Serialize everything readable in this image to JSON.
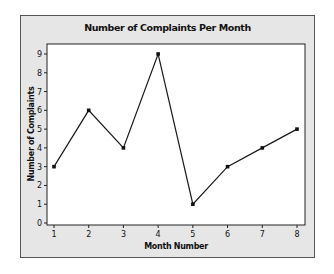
{
  "chart_data": {
    "type": "line",
    "title": "Number of Complaints Per Month",
    "xlabel": "Month Number",
    "ylabel": "Number of Complaints",
    "x": [
      1,
      2,
      3,
      4,
      5,
      6,
      7,
      8
    ],
    "values": [
      3,
      6,
      4,
      9,
      1,
      3,
      4,
      5
    ],
    "xticks": [
      "1",
      "2",
      "3",
      "4",
      "5",
      "6",
      "7",
      "8"
    ],
    "yticks": [
      "0",
      "1",
      "2",
      "3",
      "4",
      "5",
      "6",
      "7",
      "8",
      "9"
    ],
    "xlim": [
      1,
      8
    ],
    "ylim": [
      0,
      9
    ],
    "grid": false,
    "legend": "none",
    "markers": true,
    "colors": {
      "line": "#1a1a1a",
      "frame_bg": "#e6e6e6",
      "plot_bg": "#ffffff"
    }
  }
}
